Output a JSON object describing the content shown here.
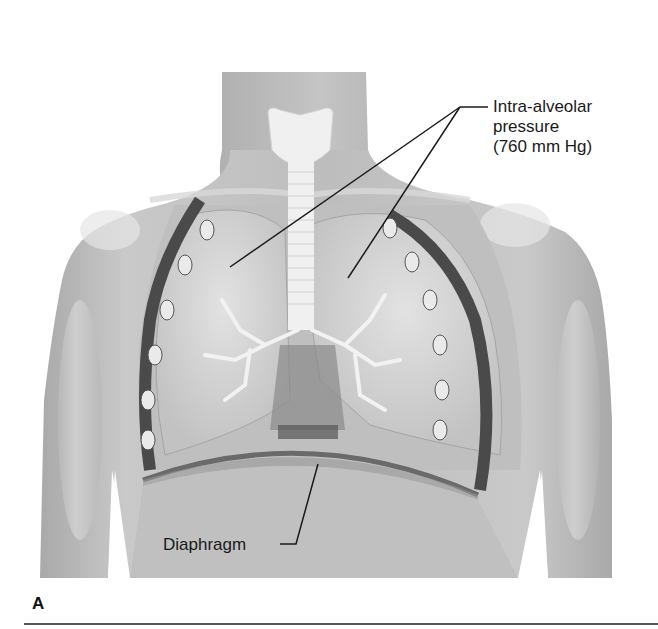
{
  "figure": {
    "panel_letter": "A",
    "labels": {
      "alveolar": {
        "line1": "Intra-alveolar",
        "line2": "pressure",
        "line3": "(760 mm Hg)"
      },
      "diaphragm": "Diaphragm"
    },
    "colors": {
      "skin": "#b8b8b8",
      "skin_light": "#d9d9d9",
      "lung": "#d2d2d2",
      "dark": "#4a4a4a",
      "trachea": "#f0f0f0",
      "leader_line": "#1a1a1a"
    }
  }
}
